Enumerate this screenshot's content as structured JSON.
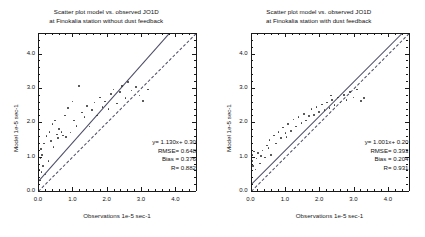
{
  "figure": {
    "x_axis_title": "Observations 1e-5 sec-1",
    "y_axis_title": "Model 1e-5 sec-1",
    "tick_labels": [
      "0.0",
      "1.0",
      "2.0",
      "3.0",
      "4.0"
    ]
  },
  "panels": [
    {
      "id": "left",
      "title_line1": "Scatter plot model vs. observed JO1D",
      "title_line2": "at Finokalia station without dust feedback",
      "stats": {
        "equation": "y= 1.130x+ 0.30",
        "rmse": "RMSE= 0.648",
        "bias": "Bias  = 0.376",
        "r": "R= 0.882"
      }
    },
    {
      "id": "right",
      "title_line1": "Scatter plot model vs. observed JO1D",
      "title_line2": "at Finokalia station with dust feedback",
      "stats": {
        "equation": "y= 1.001x+ 0.20",
        "rmse": "RMSE= 0.393",
        "bias": "Bias  = 0.204",
        "r": "R= 0.931"
      }
    }
  ],
  "chart_data": [
    {
      "type": "scatter",
      "panel": "left",
      "title": "Scatter plot model vs. observed JO1D at Finokalia station without dust feedback",
      "xlabel": "Observations 1e-5 sec-1",
      "ylabel": "Model 1e-5 sec-1",
      "xlim": [
        0.0,
        4.6
      ],
      "ylim": [
        0.0,
        4.6
      ],
      "xticks": [
        0.0,
        1.0,
        2.0,
        3.0,
        4.0
      ],
      "yticks": [
        0.0,
        1.0,
        2.0,
        3.0,
        4.0
      ],
      "minor_tick_step": 0.2,
      "grid": false,
      "legend": "none",
      "fit": {
        "slope": 1.13,
        "intercept": 0.3,
        "style": "solid",
        "label": "y= 1.130x+ 0.30"
      },
      "reference_line": {
        "slope": 1.0,
        "intercept": 0.0,
        "style": "dashed",
        "label": "1:1 line"
      },
      "statistics": {
        "rmse": 0.648,
        "bias": 0.376,
        "r": 0.882
      },
      "points": [
        [
          0.03,
          0.62
        ],
        [
          0.05,
          0.3
        ],
        [
          0.07,
          0.95
        ],
        [
          0.08,
          1.22
        ],
        [
          0.1,
          0.55
        ],
        [
          0.12,
          1.05
        ],
        [
          0.15,
          0.72
        ],
        [
          0.18,
          1.38
        ],
        [
          0.22,
          0.48
        ],
        [
          0.25,
          1.6
        ],
        [
          0.3,
          0.88
        ],
        [
          0.33,
          1.72
        ],
        [
          0.38,
          1.45
        ],
        [
          0.42,
          1.95
        ],
        [
          0.45,
          1.28
        ],
        [
          0.5,
          2.05
        ],
        [
          0.55,
          1.65
        ],
        [
          0.58,
          1.55
        ],
        [
          0.62,
          1.8
        ],
        [
          0.68,
          1.72
        ],
        [
          0.72,
          1.62
        ],
        [
          0.78,
          2.2
        ],
        [
          0.82,
          1.58
        ],
        [
          0.88,
          2.42
        ],
        [
          0.95,
          1.7
        ],
        [
          1.0,
          2.6
        ],
        [
          1.05,
          2.05
        ],
        [
          1.12,
          1.9
        ],
        [
          1.2,
          3.05
        ],
        [
          1.28,
          2.28
        ],
        [
          1.35,
          2.15
        ],
        [
          1.42,
          2.48
        ],
        [
          1.5,
          1.88
        ],
        [
          1.58,
          2.35
        ],
        [
          1.65,
          2.58
        ],
        [
          1.72,
          2.2
        ],
        [
          1.8,
          2.72
        ],
        [
          1.88,
          2.45
        ],
        [
          1.95,
          2.6
        ],
        [
          2.05,
          2.38
        ],
        [
          2.12,
          2.82
        ],
        [
          2.2,
          2.95
        ],
        [
          2.3,
          2.55
        ],
        [
          2.38,
          2.88
        ],
        [
          2.45,
          3.05
        ],
        [
          2.55,
          2.7
        ],
        [
          2.62,
          3.18
        ],
        [
          2.72,
          2.92
        ],
        [
          2.85,
          3.02
        ],
        [
          2.95,
          2.78
        ],
        [
          3.05,
          2.62
        ],
        [
          3.2,
          2.95
        ]
      ]
    },
    {
      "type": "scatter",
      "panel": "right",
      "title": "Scatter plot model vs. observed JO1D at Finokalia station with dust feedback",
      "xlabel": "Observations 1e-5 sec-1",
      "ylabel": "Model 1e-5 sec-1",
      "xlim": [
        0.0,
        4.6
      ],
      "ylim": [
        0.0,
        4.6
      ],
      "xticks": [
        0.0,
        1.0,
        2.0,
        3.0,
        4.0
      ],
      "yticks": [
        0.0,
        1.0,
        2.0,
        3.0,
        4.0
      ],
      "minor_tick_step": 0.2,
      "grid": false,
      "legend": "none",
      "fit": {
        "slope": 1.001,
        "intercept": 0.2,
        "style": "solid",
        "label": "y= 1.001x+ 0.20"
      },
      "reference_line": {
        "slope": 1.0,
        "intercept": 0.0,
        "style": "dashed",
        "label": "1:1 line"
      },
      "statistics": {
        "rmse": 0.393,
        "bias": 0.204,
        "r": 0.931
      },
      "points": [
        [
          0.03,
          0.45
        ],
        [
          0.05,
          0.88
        ],
        [
          0.06,
          1.05
        ],
        [
          0.08,
          0.72
        ],
        [
          0.1,
          1.15
        ],
        [
          0.14,
          0.62
        ],
        [
          0.18,
          0.95
        ],
        [
          0.22,
          1.1
        ],
        [
          0.28,
          0.8
        ],
        [
          0.35,
          1.18
        ],
        [
          0.42,
          0.98
        ],
        [
          0.48,
          1.32
        ],
        [
          0.55,
          1.48
        ],
        [
          0.6,
          1.05
        ],
        [
          0.68,
          1.62
        ],
        [
          0.75,
          1.38
        ],
        [
          0.82,
          1.72
        ],
        [
          0.88,
          1.55
        ],
        [
          0.95,
          1.85
        ],
        [
          1.02,
          1.68
        ],
        [
          1.1,
          1.95
        ],
        [
          1.18,
          1.75
        ],
        [
          1.25,
          2.08
        ],
        [
          1.32,
          1.88
        ],
        [
          1.4,
          2.15
        ],
        [
          1.48,
          1.98
        ],
        [
          1.55,
          2.25
        ],
        [
          1.62,
          2.05
        ],
        [
          1.7,
          2.18
        ],
        [
          1.78,
          2.38
        ],
        [
          1.85,
          2.22
        ],
        [
          1.92,
          2.45
        ],
        [
          2.0,
          2.3
        ],
        [
          2.08,
          2.52
        ],
        [
          2.15,
          2.35
        ],
        [
          2.22,
          2.58
        ],
        [
          2.3,
          2.42
        ],
        [
          2.38,
          2.65
        ],
        [
          2.45,
          2.5
        ],
        [
          2.55,
          2.72
        ],
        [
          2.62,
          2.58
        ],
        [
          2.72,
          2.8
        ],
        [
          2.8,
          2.65
        ],
        [
          2.9,
          2.88
        ],
        [
          3.0,
          2.72
        ],
        [
          3.1,
          2.95
        ],
        [
          3.22,
          2.62
        ],
        [
          2.35,
          2.78
        ],
        [
          1.05,
          1.58
        ],
        [
          0.52,
          1.25
        ],
        [
          0.3,
          1.02
        ],
        [
          3.3,
          2.7
        ]
      ]
    }
  ]
}
